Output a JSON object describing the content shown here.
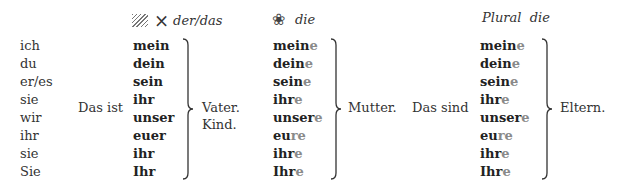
{
  "headers": {
    "masc_neut": {
      "icon_hatch": "hatch-icon",
      "icon_x": "×",
      "label": "der/das"
    },
    "fem": {
      "icon": "❀",
      "label": "die"
    },
    "plural": {
      "label": "Plural  die"
    }
  },
  "pronouns": [
    "ich",
    "du",
    "er/es",
    "sie",
    "wir",
    "ihr",
    "sie",
    "Sie"
  ],
  "intro_singular": "Das ist",
  "intro_plural": "Das sind",
  "masc_neut_forms": [
    "mein",
    "dein",
    "sein",
    "ihr",
    "unser",
    "euer",
    "ihr",
    "Ihr"
  ],
  "fem_forms": [
    {
      "stem": "mein",
      "ending": "e"
    },
    {
      "stem": "dein",
      "ending": "e"
    },
    {
      "stem": "sein",
      "ending": "e"
    },
    {
      "stem": "ihr",
      "ending": "e"
    },
    {
      "stem": "unser",
      "ending": "e"
    },
    {
      "stem": "eu",
      "ending": "re"
    },
    {
      "stem": "ihr",
      "ending": "e"
    },
    {
      "stem": "Ihr",
      "ending": "e"
    }
  ],
  "plural_forms": [
    {
      "stem": "mein",
      "ending": "e"
    },
    {
      "stem": "dein",
      "ending": "e"
    },
    {
      "stem": "sein",
      "ending": "e"
    },
    {
      "stem": "ihr",
      "ending": "e"
    },
    {
      "stem": "unser",
      "ending": "e"
    },
    {
      "stem": "eu",
      "ending": "re"
    },
    {
      "stem": "ihr",
      "ending": "e"
    },
    {
      "stem": "Ihr",
      "ending": "e"
    }
  ],
  "nouns": {
    "masc": "Vater.",
    "neut": "Kind.",
    "fem": "Mutter.",
    "plural": "Eltern."
  },
  "colors": {
    "ending": "#8a8a8a",
    "text": "#2a2a2a"
  }
}
